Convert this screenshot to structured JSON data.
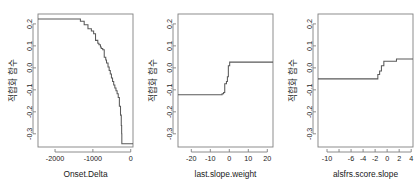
{
  "figure": {
    "type": "multi-panel-step-plot",
    "panel_count": 3,
    "background": "#ffffff",
    "line_color": "#595959",
    "axis_color": "#808080"
  },
  "chart_data": [
    {
      "type": "line",
      "title": "",
      "xlabel": "Onset.Delta",
      "ylabel": "적합화 함수",
      "xlim": [
        -2450,
        60
      ],
      "ylim": [
        -0.36,
        0.245
      ],
      "xticks": [
        -2000,
        -1000,
        0
      ],
      "xtick_labels": [
        "-2000",
        "-1000",
        "0"
      ],
      "yticks": [
        0.2,
        0.1,
        0.0,
        -0.1,
        -0.2,
        -0.3
      ],
      "ytick_labels": [
        "0.2",
        "0.1",
        "0.0",
        "-0.1",
        "-0.2",
        "-0.3"
      ],
      "grid": false,
      "legend": "none",
      "x": [
        -2450,
        -1330,
        -1330,
        -1230,
        -1230,
        -1130,
        -1130,
        -1040,
        -1040,
        -980,
        -980,
        -930,
        -930,
        -870,
        -870,
        -840,
        -840,
        -800,
        -800,
        -780,
        -780,
        -740,
        -740,
        -700,
        -700,
        -660,
        -660,
        -640,
        -640,
        -600,
        -600,
        -570,
        -570,
        -540,
        -540,
        -510,
        -510,
        -480,
        -480,
        -450,
        -450,
        -420,
        -420,
        -390,
        -390,
        -360,
        -360,
        -330,
        -330,
        -300,
        -300,
        -270,
        -270,
        -250,
        -250,
        -240,
        -240,
        -235,
        -235,
        60
      ],
      "y": [
        0.222,
        0.222,
        0.212,
        0.212,
        0.196,
        0.196,
        0.178,
        0.178,
        0.168,
        0.168,
        0.155,
        0.155,
        0.125,
        0.125,
        0.112,
        0.112,
        0.105,
        0.105,
        0.095,
        0.095,
        0.088,
        0.088,
        0.082,
        0.082,
        0.048,
        0.048,
        0.036,
        0.036,
        0.022,
        0.022,
        0.004,
        0.004,
        -0.012,
        -0.012,
        -0.028,
        -0.028,
        -0.046,
        -0.046,
        -0.062,
        -0.062,
        -0.078,
        -0.078,
        -0.092,
        -0.092,
        -0.104,
        -0.104,
        -0.118,
        -0.118,
        -0.135,
        -0.135,
        -0.175,
        -0.175,
        -0.215,
        -0.215,
        -0.262,
        -0.262,
        -0.3,
        -0.3,
        -0.345,
        -0.345
      ]
    },
    {
      "type": "line",
      "title": "",
      "xlabel": "last.slope.weight",
      "ylabel": "적합화 함수",
      "xlim": [
        -27,
        23
      ],
      "ylim": [
        -0.36,
        0.245
      ],
      "xticks": [
        -20,
        -10,
        0,
        10,
        20
      ],
      "xtick_labels": [
        "-20",
        "-10",
        "0",
        "10",
        "20"
      ],
      "yticks": [
        0.2,
        0.1,
        0.0,
        -0.1,
        -0.2,
        -0.3
      ],
      "ytick_labels": [
        "0.2",
        "0.1",
        "0.0",
        "-0.1",
        "-0.2",
        "-0.3"
      ],
      "grid": false,
      "legend": "none",
      "x": [
        -27,
        -3.8,
        -3.8,
        -3.0,
        -3.0,
        -2.4,
        -2.4,
        -1.5,
        -1.5,
        -1.0,
        -1.0,
        -0.5,
        -0.5,
        0.2,
        0.2,
        1.2,
        1.2,
        23
      ],
      "y": [
        -0.122,
        -0.122,
        -0.118,
        -0.118,
        -0.112,
        -0.112,
        -0.072,
        -0.072,
        -0.062,
        -0.062,
        -0.04,
        -0.04,
        0.01,
        0.01,
        0.026,
        0.026,
        0.026,
        0.026
      ]
    },
    {
      "type": "line",
      "title": "",
      "xlabel": "alsfrs.score.slope",
      "ylabel": "적합화 함수",
      "xlim": [
        -11.5,
        4.3
      ],
      "ylim": [
        -0.36,
        0.245
      ],
      "xticks": [
        -10,
        -8,
        -6,
        -4,
        -2,
        0,
        2,
        4
      ],
      "xtick_labels": [
        "-10",
        "",
        "-6",
        "-4",
        "-2",
        "0",
        "2",
        "4"
      ],
      "yticks": [
        0.2,
        0.1,
        0.0,
        -0.1,
        -0.2,
        -0.3
      ],
      "ytick_labels": [
        "0.2",
        "0.1",
        "0.0",
        "-0.1",
        "-0.2",
        "-0.3"
      ],
      "grid": false,
      "legend": "none",
      "x": [
        -11.5,
        -1.55,
        -1.55,
        -1.25,
        -1.25,
        -0.95,
        -0.95,
        -0.55,
        -0.55,
        -0.25,
        -0.25,
        1.55,
        1.55,
        4.3
      ],
      "y": [
        -0.05,
        -0.05,
        -0.03,
        -0.03,
        -0.014,
        -0.014,
        0.01,
        0.01,
        0.03,
        0.03,
        0.03,
        0.03,
        0.04,
        0.04
      ]
    }
  ]
}
